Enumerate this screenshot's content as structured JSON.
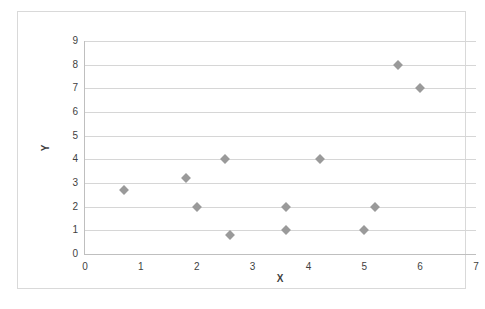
{
  "chart_data": {
    "type": "scatter",
    "title": "",
    "xlabel": "X",
    "ylabel": "Y",
    "xlim": [
      0,
      7
    ],
    "ylim": [
      0,
      9
    ],
    "xticks": [
      0,
      1,
      2,
      3,
      4,
      5,
      6,
      7
    ],
    "yticks": [
      0,
      1,
      2,
      3,
      4,
      5,
      6,
      7,
      8,
      9
    ],
    "grid": "horizontal",
    "legend": "none",
    "marker": "diamond",
    "marker_color": "#9a9a9a",
    "series": [
      {
        "name": "Series 1",
        "points": [
          {
            "x": 0.7,
            "y": 2.7
          },
          {
            "x": 1.8,
            "y": 3.2
          },
          {
            "x": 2.0,
            "y": 2.0
          },
          {
            "x": 2.5,
            "y": 4.0
          },
          {
            "x": 2.6,
            "y": 0.8
          },
          {
            "x": 3.6,
            "y": 2.0
          },
          {
            "x": 3.6,
            "y": 1.0
          },
          {
            "x": 4.2,
            "y": 4.0
          },
          {
            "x": 5.0,
            "y": 1.0
          },
          {
            "x": 5.2,
            "y": 2.0
          },
          {
            "x": 5.6,
            "y": 8.0
          },
          {
            "x": 6.0,
            "y": 7.0
          }
        ]
      }
    ]
  },
  "colors": {
    "marker": "#9a9a9a",
    "gridline": "#d6d6d6",
    "axis": "#bfbfbf",
    "border": "#d9d9d9",
    "text": "#3f3f3f"
  }
}
